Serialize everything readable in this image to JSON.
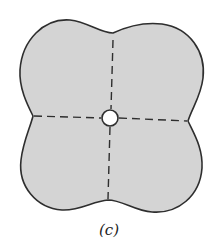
{
  "figure": {
    "caption": "(c)",
    "shape": "four-lobed-plate",
    "colors": {
      "fill": "#d4d4d4",
      "outline": "#2e2e2e",
      "axis_lines": "#2e2e2e",
      "hole_fill": "#ffffff",
      "background": "#ffffff"
    },
    "center_hole": {
      "cx": 110,
      "cy": 118,
      "r": 8
    },
    "axes": {
      "vertical": {
        "x1": 113,
        "y1": 40,
        "x2": 108,
        "y2": 198,
        "style": "dashed"
      },
      "horizontal": {
        "x1": 34,
        "y1": 116,
        "x2": 187,
        "y2": 121,
        "style": "dashed"
      }
    }
  }
}
